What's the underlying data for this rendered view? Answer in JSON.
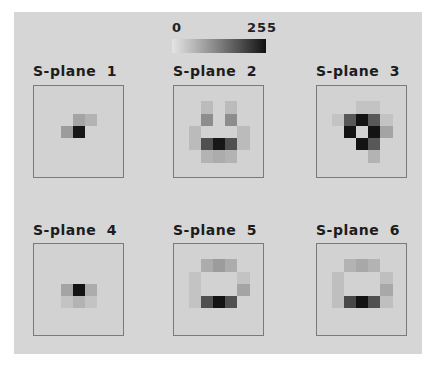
{
  "colorbar": {
    "min_label": "0",
    "max_label": "255",
    "low_color": "#e4e4e4",
    "high_color": "#111111"
  },
  "planes": [
    {
      "title": "S-plane  1",
      "cells": [
        [
          0,
          0,
          0,
          0,
          0,
          0,
          0
        ],
        [
          0,
          0,
          0,
          0,
          0,
          0,
          0
        ],
        [
          0,
          0,
          0,
          60,
          40,
          0,
          0
        ],
        [
          0,
          0,
          70,
          245,
          0,
          0,
          0
        ],
        [
          0,
          0,
          0,
          0,
          0,
          0,
          0
        ],
        [
          0,
          0,
          0,
          0,
          0,
          0,
          0
        ],
        [
          0,
          0,
          0,
          0,
          0,
          0,
          0
        ]
      ]
    },
    {
      "title": "S-plane  2",
      "cells": [
        [
          0,
          0,
          0,
          0,
          0,
          0,
          0
        ],
        [
          0,
          0,
          30,
          0,
          30,
          0,
          0
        ],
        [
          0,
          0,
          90,
          0,
          90,
          0,
          0
        ],
        [
          0,
          30,
          0,
          0,
          0,
          30,
          0
        ],
        [
          0,
          30,
          170,
          245,
          170,
          30,
          0
        ],
        [
          0,
          0,
          40,
          50,
          40,
          0,
          0
        ],
        [
          0,
          0,
          0,
          0,
          0,
          0,
          0
        ]
      ]
    },
    {
      "title": "S-plane  3",
      "cells": [
        [
          0,
          0,
          0,
          0,
          0,
          0,
          0
        ],
        [
          0,
          0,
          0,
          20,
          20,
          0,
          0
        ],
        [
          0,
          20,
          160,
          250,
          160,
          20,
          0
        ],
        [
          0,
          0,
          250,
          0,
          250,
          60,
          0
        ],
        [
          0,
          0,
          0,
          250,
          160,
          0,
          0
        ],
        [
          0,
          0,
          0,
          0,
          40,
          0,
          0
        ],
        [
          0,
          0,
          0,
          0,
          0,
          0,
          0
        ]
      ]
    },
    {
      "title": "S-plane  4",
      "cells": [
        [
          0,
          0,
          0,
          0,
          0,
          0,
          0
        ],
        [
          0,
          0,
          0,
          0,
          0,
          0,
          0
        ],
        [
          0,
          0,
          0,
          0,
          0,
          0,
          0
        ],
        [
          0,
          0,
          60,
          250,
          50,
          0,
          0
        ],
        [
          0,
          0,
          20,
          40,
          20,
          0,
          0
        ],
        [
          0,
          0,
          0,
          0,
          0,
          0,
          0
        ],
        [
          0,
          0,
          0,
          0,
          0,
          0,
          0
        ]
      ]
    },
    {
      "title": "S-plane  5",
      "cells": [
        [
          0,
          0,
          0,
          0,
          0,
          0,
          0
        ],
        [
          0,
          0,
          50,
          70,
          50,
          0,
          0
        ],
        [
          0,
          20,
          0,
          0,
          0,
          20,
          0
        ],
        [
          0,
          20,
          0,
          0,
          0,
          60,
          0
        ],
        [
          0,
          20,
          170,
          250,
          170,
          0,
          0
        ],
        [
          0,
          0,
          0,
          0,
          0,
          0,
          0
        ],
        [
          0,
          0,
          0,
          0,
          0,
          0,
          0
        ]
      ]
    },
    {
      "title": "S-plane  6",
      "cells": [
        [
          0,
          0,
          0,
          0,
          0,
          0,
          0
        ],
        [
          0,
          0,
          40,
          55,
          40,
          0,
          0
        ],
        [
          0,
          25,
          0,
          0,
          0,
          25,
          0
        ],
        [
          0,
          25,
          0,
          0,
          0,
          55,
          0
        ],
        [
          0,
          25,
          180,
          250,
          170,
          25,
          0
        ],
        [
          0,
          0,
          0,
          0,
          0,
          0,
          0
        ],
        [
          0,
          0,
          0,
          0,
          0,
          0,
          0
        ]
      ]
    }
  ]
}
